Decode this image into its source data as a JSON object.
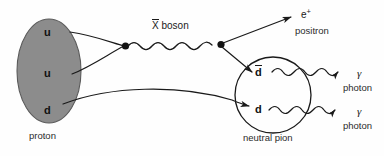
{
  "figure": {
    "background_color": "#fefefe",
    "line_color": "#1a1a1a",
    "proton_fill_color": "#8c8c8c",
    "proton_stroke_color": "#4d4d4d"
  },
  "proton": {
    "caption": "proton",
    "quarks": [
      {
        "label": "u",
        "name": "up-quark-1"
      },
      {
        "label": "u",
        "name": "up-quark-2"
      },
      {
        "label": "d",
        "name": "down-quark"
      }
    ]
  },
  "boson": {
    "symbol": "X",
    "overline": true,
    "label": "boson",
    "full_label": "X̄ boson"
  },
  "positron": {
    "symbol": "e",
    "charge": "+",
    "caption": "positron"
  },
  "pion": {
    "caption": "neutral pion",
    "quarks": [
      {
        "label": "d",
        "overline": true,
        "name": "anti-down-quark"
      },
      {
        "label": "d",
        "overline": false,
        "name": "down-quark"
      }
    ]
  },
  "photons": [
    {
      "symbol": "γ",
      "caption": "photon"
    },
    {
      "symbol": "γ",
      "caption": "photon"
    }
  ]
}
